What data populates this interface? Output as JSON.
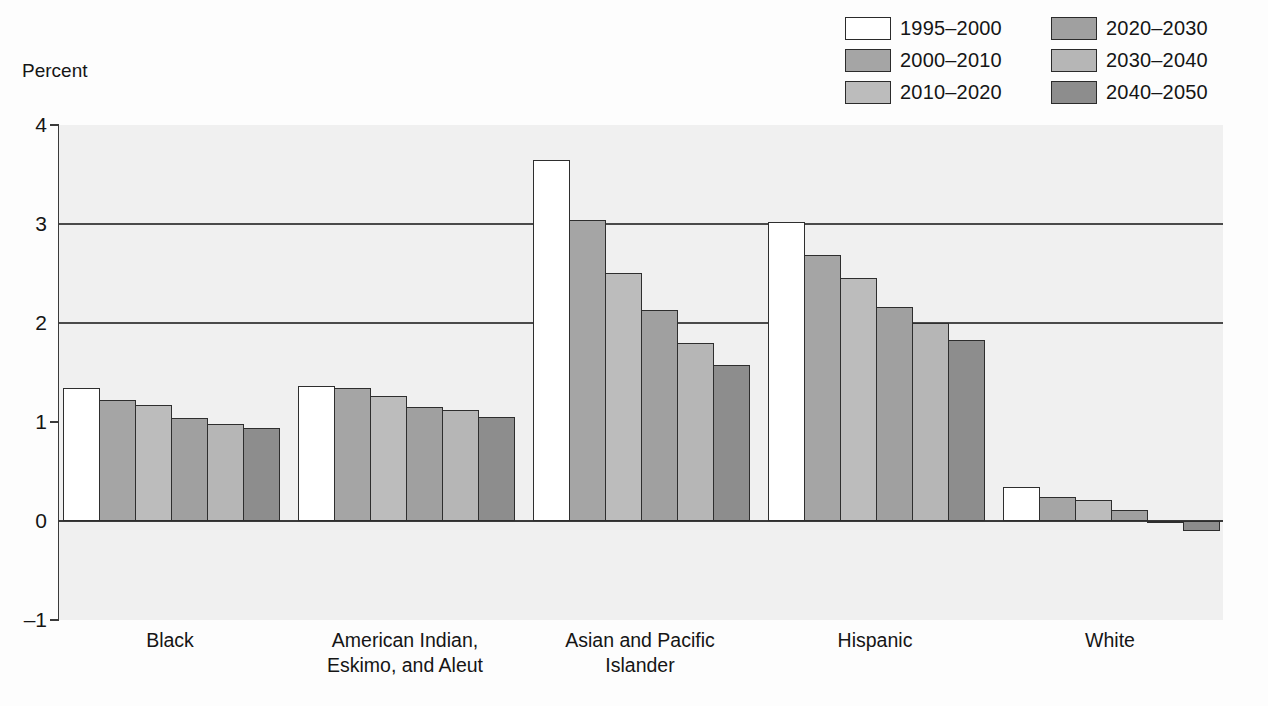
{
  "axis": {
    "ylabel": "Percent",
    "yticks": [
      "4",
      "3",
      "2",
      "1",
      "0",
      "–1"
    ]
  },
  "legend": {
    "entries": [
      {
        "label": "1995–2000",
        "color": "#ffffff"
      },
      {
        "label": "2000–2010",
        "color": "#a5a5a5"
      },
      {
        "label": "2010–2020",
        "color": "#bcbcbc"
      },
      {
        "label": "2020–2030",
        "color": "#a0a0a0"
      },
      {
        "label": "2030–2040",
        "color": "#b6b6b6"
      },
      {
        "label": "2040–2050",
        "color": "#8d8d8d"
      }
    ]
  },
  "chart_data": {
    "type": "bar",
    "title": "",
    "xlabel": "",
    "ylabel": "Percent",
    "ylim": [
      -1,
      4
    ],
    "grid": true,
    "legend_position": "top-right",
    "categories": [
      "Black",
      "American Indian, Eskimo, and Aleut",
      "Asian and Pacific Islander",
      "Hispanic",
      "White"
    ],
    "category_lines": [
      [
        "Black"
      ],
      [
        "American Indian,",
        "Eskimo, and Aleut"
      ],
      [
        "Asian and Pacific",
        "Islander"
      ],
      [
        "Hispanic"
      ],
      [
        "White"
      ]
    ],
    "series": [
      {
        "name": "1995–2000",
        "color": "#ffffff",
        "values": [
          1.34,
          1.36,
          3.65,
          3.02,
          0.34
        ]
      },
      {
        "name": "2000–2010",
        "color": "#a5a5a5",
        "values": [
          1.22,
          1.34,
          3.04,
          2.69,
          0.24
        ]
      },
      {
        "name": "2010–2020",
        "color": "#bcbcbc",
        "values": [
          1.17,
          1.26,
          2.51,
          2.45,
          0.21
        ]
      },
      {
        "name": "2020–2030",
        "color": "#a0a0a0",
        "values": [
          1.04,
          1.15,
          2.13,
          2.16,
          0.11
        ]
      },
      {
        "name": "2030–2040",
        "color": "#b6b6b6",
        "values": [
          0.98,
          1.12,
          1.8,
          2.0,
          -0.02
        ]
      },
      {
        "name": "2040–2050",
        "color": "#8d8d8d",
        "values": [
          0.94,
          1.05,
          1.58,
          1.83,
          -0.1
        ]
      }
    ]
  }
}
